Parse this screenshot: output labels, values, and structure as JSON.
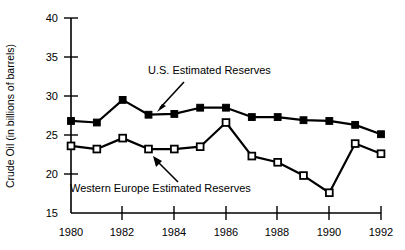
{
  "chart_data": {
    "type": "line",
    "title": "",
    "xlabel": "",
    "ylabel": "Crude Oil (in billions of barrels)",
    "x": [
      1980,
      1981,
      1982,
      1983,
      1984,
      1985,
      1986,
      1987,
      1988,
      1989,
      1990,
      1991,
      1992
    ],
    "xlim": [
      1980,
      1992
    ],
    "ylim": [
      15,
      40
    ],
    "x_tick_labels": [
      "1980",
      "1982",
      "1984",
      "1986",
      "1988",
      "1990",
      "1992"
    ],
    "x_tick_values": [
      1980,
      1982,
      1984,
      1986,
      1988,
      1990,
      1992
    ],
    "y_tick_labels": [
      "15",
      "20",
      "25",
      "30",
      "35",
      "40"
    ],
    "y_tick_values": [
      15,
      20,
      25,
      30,
      35,
      40
    ],
    "grid": false,
    "legend": "annotations-inline",
    "series": [
      {
        "name": "U.S. Estimated Reserves",
        "marker": "filled-square",
        "color": "#000000",
        "values": [
          26.8,
          26.6,
          29.5,
          27.6,
          27.7,
          28.5,
          28.5,
          27.3,
          27.3,
          26.9,
          26.8,
          26.3,
          25.1
        ]
      },
      {
        "name": "Western Europe Estimated Reserves",
        "marker": "open-square",
        "color": "#000000",
        "values": [
          23.6,
          23.2,
          24.6,
          23.2,
          23.2,
          23.5,
          26.6,
          22.3,
          21.5,
          19.8,
          17.6,
          23.9,
          22.6
        ]
      }
    ],
    "annotations": [
      {
        "id": "us-annotation",
        "text": "U.S. Estimated Reserves",
        "arrow": "points-down-left-to-series"
      },
      {
        "id": "we-annotation",
        "text": "Western Europe Estimated Reserves",
        "arrow": "points-up-right-to-series"
      }
    ]
  }
}
